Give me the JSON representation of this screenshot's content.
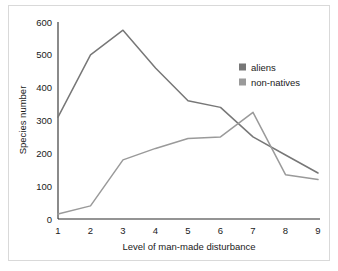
{
  "chart_data": {
    "type": "line",
    "title": "",
    "xlabel": "Level of man-made disturbance",
    "ylabel": "Species number",
    "x": [
      1,
      2,
      3,
      4,
      5,
      6,
      7,
      8,
      9
    ],
    "xticks": [
      "1",
      "2",
      "3",
      "4",
      "5",
      "6",
      "7",
      "8",
      "9"
    ],
    "yticks": [
      "0",
      "100",
      "200",
      "300",
      "400",
      "500",
      "600"
    ],
    "xlim": [
      1,
      9
    ],
    "ylim": [
      0,
      600
    ],
    "grid": false,
    "legend_position": "upper-right-inside",
    "series": [
      {
        "name": "aliens",
        "color": "#777777",
        "values": [
          310,
          500,
          575,
          460,
          360,
          340,
          250,
          195,
          140
        ]
      },
      {
        "name": "non-natives",
        "color": "#9a9a9a",
        "values": [
          15,
          40,
          180,
          215,
          245,
          250,
          325,
          135,
          120
        ]
      }
    ]
  },
  "legend": {
    "entries": [
      {
        "label": "aliens",
        "swatch_color": "#777777"
      },
      {
        "label": "non-natives",
        "swatch_color": "#9a9a9a"
      }
    ]
  },
  "axes": {
    "y_title": "Species number",
    "x_title": "Level of man-made disturbance",
    "y_tick_labels": [
      "600",
      "500",
      "400",
      "300",
      "200",
      "100",
      "0"
    ],
    "x_tick_labels": [
      "1",
      "2",
      "3",
      "4",
      "5",
      "6",
      "7",
      "8",
      "9"
    ]
  }
}
